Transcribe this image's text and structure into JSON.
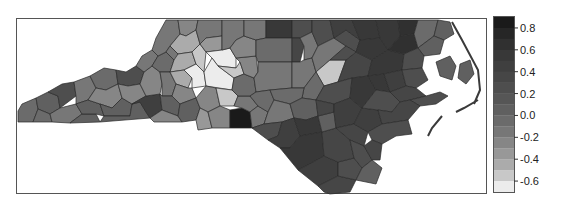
{
  "figure": {
    "type": "choropleth",
    "region": "North Carolina counties"
  },
  "chart_data": {
    "type": "heatmap",
    "subtype": "choropleth",
    "title": "",
    "colormap": "grayscale (white = low, black = high)",
    "legend": {
      "position": "right",
      "range": [
        -0.7,
        0.9
      ],
      "ticks": [
        0.8,
        0.6,
        0.4,
        0.2,
        0.0,
        -0.2,
        -0.4,
        -0.6
      ],
      "tick_labels": [
        "0.8",
        "0.6",
        "0.4",
        "0.2",
        "0.0",
        "-0.2",
        "-0.4",
        "-0.6"
      ],
      "bands": [
        {
          "from": 0.8,
          "to": 0.9,
          "color": "#1a1a1a"
        },
        {
          "from": 0.7,
          "to": 0.8,
          "color": "#262626"
        },
        {
          "from": 0.6,
          "to": 0.7,
          "color": "#303030"
        },
        {
          "from": 0.5,
          "to": 0.6,
          "color": "#383838"
        },
        {
          "from": 0.4,
          "to": 0.5,
          "color": "#3f3f3f"
        },
        {
          "from": 0.3,
          "to": 0.4,
          "color": "#464646"
        },
        {
          "from": 0.2,
          "to": 0.3,
          "color": "#4e4e4e"
        },
        {
          "from": 0.1,
          "to": 0.2,
          "color": "#565656"
        },
        {
          "from": 0.0,
          "to": 0.1,
          "color": "#606060"
        },
        {
          "from": -0.1,
          "to": 0.0,
          "color": "#6b6b6b"
        },
        {
          "from": -0.2,
          "to": -0.1,
          "color": "#777777"
        },
        {
          "from": -0.3,
          "to": -0.2,
          "color": "#868686"
        },
        {
          "from": -0.4,
          "to": -0.3,
          "color": "#989898"
        },
        {
          "from": -0.5,
          "to": -0.4,
          "color": "#ababab"
        },
        {
          "from": -0.6,
          "to": -0.5,
          "color": "#c8c8c8"
        },
        {
          "from": -0.7,
          "to": -0.6,
          "color": "#ececec"
        }
      ]
    },
    "notable_regions": [
      {
        "area": "south-central small county (darkest)",
        "approx_value": 0.85
      },
      {
        "area": "northeast / coastal plain counties",
        "approx_value": 0.4
      },
      {
        "area": "north-central Piedmont counties (lightest)",
        "approx_value": -0.6
      },
      {
        "area": "central county near Raleigh area (light)",
        "approx_value": -0.45
      },
      {
        "area": "western mountain counties",
        "approx_value": -0.05
      }
    ]
  }
}
